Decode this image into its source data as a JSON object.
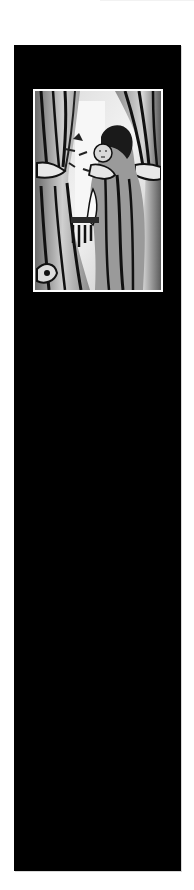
{
  "page": {
    "background_color": "#ffffff"
  },
  "panel": {
    "background_color": "#000000"
  },
  "artwork": {
    "description": "Woodcut-style black and white illustration of a hooded woman holding a child between two drawn curtains",
    "frame_color": "#ffffff",
    "style": "linocut"
  }
}
